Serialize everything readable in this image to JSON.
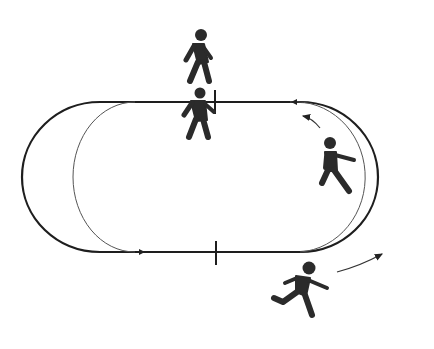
{
  "diagram": {
    "title": "",
    "colors": {
      "track": "#1e1e1e",
      "figure": "#2b2b2b",
      "background": "#ffffff",
      "inner_lane": "#555555"
    },
    "elements": [
      {
        "name": "outer-track",
        "type": "stadium-oval"
      },
      {
        "name": "inner-lane",
        "type": "curve"
      },
      {
        "name": "walker-top",
        "type": "person-walking"
      },
      {
        "name": "walker-at-line",
        "type": "person-walking"
      },
      {
        "name": "runner-curve",
        "type": "person-running"
      },
      {
        "name": "runner-bottom",
        "type": "person-running"
      },
      {
        "name": "direction-arrow-top",
        "type": "arrow"
      },
      {
        "name": "direction-arrow-bottom",
        "type": "arrow"
      },
      {
        "name": "start-mark-top",
        "type": "tick"
      },
      {
        "name": "start-mark-bottom",
        "type": "tick"
      }
    ]
  }
}
